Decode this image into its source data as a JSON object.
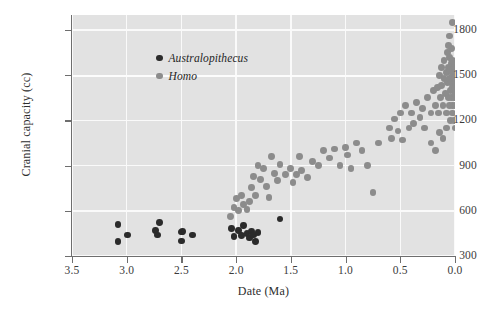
{
  "chart_data": {
    "type": "scatter",
    "title": "",
    "xlabel": "Date (Ma)",
    "ylabel": "Cranial capacity (cc)",
    "xlim": [
      3.5,
      0.0
    ],
    "ylim": [
      300,
      1900
    ],
    "x_reversed": true,
    "grid": true,
    "legend_position": "top-left-inside",
    "xticks": [
      "3.5",
      "3.0",
      "2.5",
      "2.0",
      "1.5",
      "1.0",
      "0.5",
      "0.0"
    ],
    "xtick_values": [
      3.5,
      3.0,
      2.5,
      2.0,
      1.5,
      1.0,
      0.5,
      0.0
    ],
    "yticks": [
      "300",
      "600",
      "900",
      "1200",
      "1500",
      "1800"
    ],
    "ytick_values": [
      300,
      600,
      900,
      1200,
      1500,
      1800
    ],
    "colors": {
      "panel_background": "#e2e2e2",
      "gridline": "#fafafa",
      "axis": "#6e6e6e",
      "australopithecus": "#2b2b2b",
      "homo": "#8c8c8c"
    },
    "series": [
      {
        "name": "Australopithecus",
        "color": "#2b2b2b",
        "marker": "circle",
        "points": [
          [
            3.08,
            510
          ],
          [
            3.08,
            395
          ],
          [
            2.99,
            440
          ],
          [
            2.74,
            470
          ],
          [
            2.72,
            440
          ],
          [
            2.7,
            520
          ],
          [
            2.5,
            460
          ],
          [
            2.5,
            400
          ],
          [
            2.49,
            465
          ],
          [
            2.4,
            440
          ],
          [
            2.04,
            480
          ],
          [
            2.02,
            430
          ],
          [
            1.98,
            470
          ],
          [
            1.95,
            435
          ],
          [
            1.93,
            500
          ],
          [
            1.9,
            450
          ],
          [
            1.88,
            420
          ],
          [
            1.86,
            465
          ],
          [
            1.84,
            440
          ],
          [
            1.82,
            395
          ],
          [
            1.8,
            455
          ],
          [
            1.6,
            545
          ]
        ]
      },
      {
        "name": "Homo",
        "color": "#8c8c8c",
        "marker": "circle",
        "points": [
          [
            2.05,
            560
          ],
          [
            2.02,
            620
          ],
          [
            2.0,
            680
          ],
          [
            1.98,
            600
          ],
          [
            1.95,
            700
          ],
          [
            1.93,
            640
          ],
          [
            1.9,
            610
          ],
          [
            1.88,
            660
          ],
          [
            1.86,
            755
          ],
          [
            1.84,
            830
          ],
          [
            1.82,
            700
          ],
          [
            1.8,
            900
          ],
          [
            1.78,
            810
          ],
          [
            1.75,
            880
          ],
          [
            1.72,
            760
          ],
          [
            1.7,
            690
          ],
          [
            1.68,
            960
          ],
          [
            1.65,
            850
          ],
          [
            1.62,
            800
          ],
          [
            1.6,
            910
          ],
          [
            1.55,
            840
          ],
          [
            1.5,
            880
          ],
          [
            1.48,
            790
          ],
          [
            1.45,
            840
          ],
          [
            1.42,
            960
          ],
          [
            1.4,
            870
          ],
          [
            1.35,
            820
          ],
          [
            1.3,
            930
          ],
          [
            1.25,
            900
          ],
          [
            1.2,
            1000
          ],
          [
            1.15,
            950
          ],
          [
            1.1,
            1010
          ],
          [
            1.05,
            900
          ],
          [
            1.0,
            1020
          ],
          [
            0.98,
            970
          ],
          [
            0.95,
            880
          ],
          [
            0.9,
            1050
          ],
          [
            0.85,
            1000
          ],
          [
            0.8,
            900
          ],
          [
            0.75,
            720
          ],
          [
            0.7,
            1050
          ],
          [
            0.6,
            1150
          ],
          [
            0.58,
            1080
          ],
          [
            0.55,
            1210
          ],
          [
            0.52,
            1130
          ],
          [
            0.5,
            1250
          ],
          [
            0.48,
            1070
          ],
          [
            0.45,
            1300
          ],
          [
            0.42,
            1150
          ],
          [
            0.4,
            1250
          ],
          [
            0.38,
            1180
          ],
          [
            0.35,
            1320
          ],
          [
            0.32,
            1220
          ],
          [
            0.3,
            1280
          ],
          [
            0.28,
            1150
          ],
          [
            0.25,
            1350
          ],
          [
            0.22,
            1250
          ],
          [
            0.2,
            1400
          ],
          [
            0.18,
            1300
          ],
          [
            0.16,
            1420
          ],
          [
            0.15,
            1250
          ],
          [
            0.14,
            1500
          ],
          [
            0.13,
            1350
          ],
          [
            0.12,
            1550
          ],
          [
            0.12,
            1430
          ],
          [
            0.11,
            1300
          ],
          [
            0.1,
            1600
          ],
          [
            0.1,
            1480
          ],
          [
            0.09,
            1380
          ],
          [
            0.08,
            1520
          ],
          [
            0.08,
            1250
          ],
          [
            0.07,
            1650
          ],
          [
            0.07,
            1450
          ],
          [
            0.06,
            1350
          ],
          [
            0.06,
            1550
          ],
          [
            0.05,
            1480
          ],
          [
            0.05,
            1300
          ],
          [
            0.05,
            1620
          ],
          [
            0.04,
            1400
          ],
          [
            0.04,
            1530
          ],
          [
            0.04,
            1200
          ],
          [
            0.03,
            1450
          ],
          [
            0.03,
            1580
          ],
          [
            0.03,
            1350
          ],
          [
            0.03,
            1680
          ],
          [
            0.02,
            1500
          ],
          [
            0.02,
            1300
          ],
          [
            0.02,
            1420
          ],
          [
            0.02,
            1600
          ],
          [
            0.02,
            1250
          ],
          [
            0.01,
            1350
          ],
          [
            0.01,
            1480
          ],
          [
            0.01,
            1550
          ],
          [
            0.01,
            1200
          ],
          [
            0.01,
            1400
          ],
          [
            0.0,
            1300
          ],
          [
            0.0,
            1450
          ],
          [
            0.0,
            1520
          ],
          [
            0.0,
            1150
          ],
          [
            0.0,
            1380
          ],
          [
            0.02,
            1850
          ],
          [
            0.05,
            1760
          ],
          [
            0.06,
            1700
          ],
          [
            0.08,
            1150
          ],
          [
            0.11,
            1080
          ],
          [
            0.14,
            1120
          ],
          [
            0.18,
            1000
          ],
          [
            0.22,
            1050
          ]
        ]
      }
    ]
  }
}
